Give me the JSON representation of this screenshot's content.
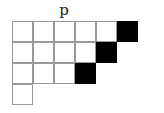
{
  "diagram": {
    "label": "p",
    "type": "young-diagram",
    "row_lengths": [
      6,
      5,
      4,
      1
    ],
    "shaded_cells": [
      [
        0,
        5
      ],
      [
        1,
        4
      ],
      [
        2,
        3
      ]
    ],
    "colors": {
      "shaded": "#000000",
      "empty": "#ffffff",
      "grid": "#9a9a9a"
    }
  }
}
